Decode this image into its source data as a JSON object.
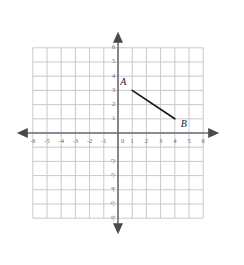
{
  "chart_data": {
    "type": "scatter",
    "title": "",
    "xlabel": "",
    "ylabel": "",
    "xlim": [
      -6,
      6
    ],
    "ylim": [
      -6,
      6
    ],
    "grid": true,
    "legend": null,
    "origin_label": "0",
    "x_ticks": [
      -6,
      -5,
      -4,
      -3,
      -2,
      -1,
      1,
      2,
      3,
      4,
      5,
      6
    ],
    "y_ticks": [
      6,
      5,
      4,
      3,
      2,
      1,
      -2,
      -3,
      -4,
      -5,
      -6
    ],
    "x_tick_labels": [
      "-6",
      "-5",
      "-4",
      "-3",
      "-2",
      "-1",
      "1",
      "2",
      "3",
      "4",
      "5",
      "6"
    ],
    "y_tick_labels": [
      "6",
      "5",
      "4",
      "3",
      "2",
      "1",
      "-2",
      "-3",
      "-4",
      "-5",
      "-6"
    ],
    "points": [
      {
        "name": "A",
        "label": "A",
        "x": 1,
        "y": 3
      },
      {
        "name": "B",
        "label": "B",
        "x": 4,
        "y": 1
      }
    ],
    "segments": [
      {
        "name": "segment-AB",
        "from": "A",
        "to": "B"
      }
    ],
    "colors": {
      "grid": "#c9c9cd",
      "axis": "#6e6e72",
      "segment": "#17171a",
      "tick_text": "#6b6b70",
      "point_label": "#1b1b1f",
      "background": "#ffffff"
    }
  }
}
